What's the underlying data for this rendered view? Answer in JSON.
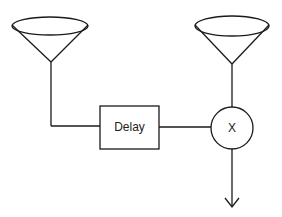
{
  "diagram": {
    "type": "block-diagram",
    "nodes": [
      {
        "id": "antenna-left",
        "kind": "antenna"
      },
      {
        "id": "antenna-right",
        "kind": "antenna"
      },
      {
        "id": "delay",
        "kind": "box",
        "label": "Delay"
      },
      {
        "id": "multiplier",
        "kind": "circle",
        "label": "X"
      }
    ],
    "edges": [
      {
        "from": "antenna-left",
        "to": "delay"
      },
      {
        "from": "delay",
        "to": "multiplier"
      },
      {
        "from": "antenna-right",
        "to": "multiplier"
      },
      {
        "from": "multiplier",
        "to": "output",
        "arrow": true
      }
    ],
    "delay_label": "Delay",
    "multiplier_label": "X"
  }
}
